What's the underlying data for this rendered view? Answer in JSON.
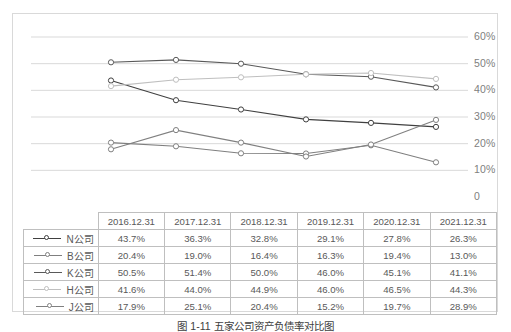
{
  "chart_data": {
    "type": "line",
    "title": "",
    "xlabel": "",
    "ylabel": "",
    "categories": [
      "2016.12.31",
      "2017.12.31",
      "2018.12.31",
      "2019.12.31",
      "2020.12.31",
      "2021.12.31"
    ],
    "ylim": [
      0,
      60
    ],
    "ytick_labels": [
      "0",
      "10%",
      "20%",
      "30%",
      "40%",
      "50%",
      "60%"
    ],
    "ytick_values": [
      0,
      10,
      20,
      30,
      40,
      50,
      60
    ],
    "grid": true,
    "legend_position": "table-row-labels",
    "series": [
      {
        "name": "N公司",
        "color": "#404040",
        "values": [
          43.7,
          36.3,
          32.8,
          29.1,
          27.8,
          26.3
        ],
        "labels": [
          "43.7%",
          "36.3%",
          "32.8%",
          "29.1%",
          "27.8%",
          "26.3%"
        ]
      },
      {
        "name": "B公司",
        "color": "#7f7f7f",
        "values": [
          20.4,
          19.0,
          16.4,
          16.3,
          19.4,
          13.0
        ],
        "labels": [
          "20.4%",
          "19.0%",
          "16.4%",
          "16.3%",
          "19.4%",
          "13.0%"
        ]
      },
      {
        "name": "K公司",
        "color": "#595959",
        "values": [
          50.5,
          51.4,
          50.0,
          46.0,
          45.1,
          41.1
        ],
        "labels": [
          "50.5%",
          "51.4%",
          "50.0%",
          "46.0%",
          "45.1%",
          "41.1%"
        ]
      },
      {
        "name": "H公司",
        "color": "#bfbfbf",
        "values": [
          41.6,
          44.0,
          44.9,
          46.0,
          46.5,
          44.3
        ],
        "labels": [
          "41.6%",
          "44.0%",
          "44.9%",
          "46.0%",
          "46.5%",
          "44.3%"
        ]
      },
      {
        "name": "J公司",
        "color": "#808080",
        "values": [
          17.9,
          25.1,
          20.4,
          15.2,
          19.7,
          28.9
        ],
        "labels": [
          "17.9%",
          "25.1%",
          "20.4%",
          "15.2%",
          "19.7%",
          "28.9%"
        ]
      }
    ]
  },
  "table": {
    "corner_label": "",
    "column_headers": [
      "2016.12.31",
      "2017.12.31",
      "2018.12.31",
      "2019.12.31",
      "2020.12.31",
      "2021.12.31"
    ],
    "rows": [
      {
        "series": "N公司",
        "values": [
          "43.7%",
          "36.3%",
          "32.8%",
          "29.1%",
          "27.8%",
          "26.3%"
        ]
      },
      {
        "series": "B公司",
        "values": [
          "20.4%",
          "19.0%",
          "16.4%",
          "16.3%",
          "19.4%",
          "13.0%"
        ]
      },
      {
        "series": "K公司",
        "values": [
          "50.5%",
          "51.4%",
          "50.0%",
          "46.0%",
          "45.1%",
          "41.1%"
        ]
      },
      {
        "series": "H公司",
        "values": [
          "41.6%",
          "44.0%",
          "44.9%",
          "46.0%",
          "46.5%",
          "44.3%"
        ]
      },
      {
        "series": "J公司",
        "values": [
          "17.9%",
          "25.1%",
          "20.4%",
          "15.2%",
          "19.7%",
          "28.9%"
        ]
      }
    ]
  },
  "caption": "图 1-11  五家公司资产负债率对比图",
  "colors": {
    "gridline": "#d9d9d9",
    "frame": "#d9d9d9",
    "axis_text": "#808080",
    "table_border": "#bfbfbf"
  }
}
